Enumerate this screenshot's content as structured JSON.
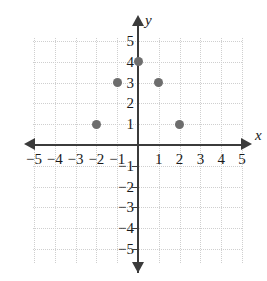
{
  "figure": {
    "kind": "cartesian-coordinate-plane",
    "point_color": "#6d6d6d",
    "axis_color": "#3b3b3b",
    "grid_color": "#cfcfcf"
  },
  "axes": {
    "x_label": "x",
    "y_label": "y",
    "x_ticks": [
      "-5",
      "-4",
      "-3",
      "-2",
      "-1",
      "1",
      "2",
      "3",
      "4",
      "5"
    ],
    "y_ticks": [
      "5",
      "4",
      "3",
      "2",
      "1",
      "-1",
      "-2",
      "-3",
      "-4",
      "-5"
    ]
  },
  "chart_data": {
    "type": "scatter",
    "title": "",
    "xlabel": "x",
    "ylabel": "y",
    "xlim": [
      -5,
      5
    ],
    "ylim": [
      -5,
      5
    ],
    "grid": true,
    "legend": "none",
    "xticks": [
      -5,
      -4,
      -3,
      -2,
      -1,
      1,
      2,
      3,
      4,
      5
    ],
    "yticks": [
      5,
      4,
      3,
      2,
      1,
      -1,
      -2,
      -3,
      -4,
      -5
    ],
    "series": [
      {
        "name": "points",
        "marker": "filled-circle",
        "color": "#6d6d6d",
        "points": [
          {
            "x": -2,
            "y": 1
          },
          {
            "x": -1,
            "y": 3
          },
          {
            "x": 0,
            "y": 4
          },
          {
            "x": 1,
            "y": 3
          },
          {
            "x": 2,
            "y": 1
          }
        ]
      }
    ]
  }
}
